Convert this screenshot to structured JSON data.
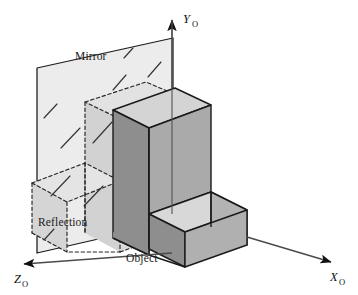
{
  "figure": {
    "kind": "technical-line-diagram",
    "title_visible": false,
    "background_color": "#ffffff",
    "stroke_color": "#1a1a1a",
    "labels": {
      "mirror": "Mirror",
      "reflection": "Reflection",
      "object": "Object"
    },
    "axes": [
      {
        "id": "y",
        "base": "Y",
        "subscript": "O",
        "label": "YO",
        "direction": "up"
      },
      {
        "id": "x",
        "base": "X",
        "subscript": "O",
        "label": "XO",
        "direction": "down-right"
      },
      {
        "id": "z",
        "base": "Z",
        "subscript": "O",
        "label": "ZO",
        "direction": "down-left"
      }
    ],
    "colors": {
      "mirror_plane_fill": "#e9e9e9",
      "reflection_fill": "#dcdcdc",
      "object_top_light": "#d6d6d6",
      "object_left_mid": "#a9a9a9",
      "object_front_dark": "#8f8f8f",
      "object_right_mid": "#b4b4b4",
      "outline": "#1a1a1a",
      "dashed_outline": "#2b2b2b"
    },
    "geometry": {
      "origin": {
        "x": 172,
        "y": 253
      },
      "y_axis_tip": {
        "x": 172,
        "y": 14
      },
      "x_axis_tip": {
        "x": 334,
        "y": 263
      },
      "z_axis_tip": {
        "x": 20,
        "y": 265
      },
      "mirror_plane_corners": [
        {
          "x": 37,
          "y": 68
        },
        {
          "x": 173,
          "y": 38
        },
        {
          "x": 173,
          "y": 222
        },
        {
          "x": 37,
          "y": 253
        }
      ],
      "object_description": "L-shaped (stepped) solid block resting at the origin, tall slab against mirror plane plus low step extending along +X",
      "reflection_description": "dashed mirrored copy of the L-block behind the mirror plane"
    },
    "hatch_marks": {
      "count": 9,
      "description": "short diagonal tick strokes indicating the mirror surface"
    }
  }
}
